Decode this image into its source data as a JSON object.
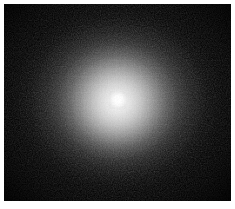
{
  "image": {
    "title": "Diffuse luminous source on dark sky background",
    "kind": "grayscale-astronomical-image",
    "colorspace": "grayscale",
    "frame": {
      "outer_width_px": 235,
      "outer_height_px": 209,
      "margin_color": "#ffffff",
      "margin_left_px": 4,
      "margin_top_px": 4,
      "margin_right_px": 4,
      "margin_bottom_px": 8,
      "field_width_px": 227,
      "field_height_px": 197
    },
    "background": {
      "label": "dark sky background",
      "color": "#050505",
      "noise": "fine monochrome pixel grain",
      "noise_amplitude": "low"
    },
    "source": {
      "label": "central glowing source",
      "center_x_px": 118,
      "center_y_px": 100,
      "core_color": "#ffffff",
      "core_radius_px": 9,
      "inner_halo_radius_px": 32,
      "mid_halo_radius_x_px": 95,
      "mid_halo_radius_y_px": 88,
      "profile": "smooth radial falloff, saturated core to black sky",
      "shape": "slightly elliptical, wider than tall",
      "peak_brightness": 255,
      "background_brightness": 5
    },
    "text_content": "none",
    "annotations": "none",
    "axes": "none",
    "colorbar": "none"
  }
}
